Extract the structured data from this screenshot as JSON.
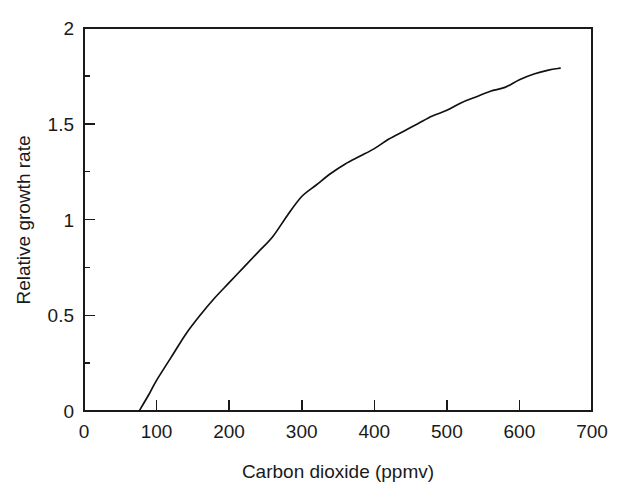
{
  "chart_data": {
    "type": "line",
    "title": "",
    "xlabel": "Carbon dioxide (ppmv)",
    "ylabel": "Relative growth rate",
    "xlim": [
      0,
      700
    ],
    "ylim": [
      0,
      2
    ],
    "grid": false,
    "legend": null,
    "x_ticks": [
      0,
      100,
      200,
      300,
      400,
      500,
      600,
      700
    ],
    "x_tick_labels": [
      "0",
      "100",
      "200",
      "300",
      "400",
      "500",
      "600",
      "700"
    ],
    "y_ticks": [
      0,
      0.5,
      1,
      1.5,
      2
    ],
    "y_tick_labels": [
      "0",
      "0.5",
      "1",
      "1.5",
      "2"
    ],
    "y_minor_ticks": [
      0.25,
      0.75,
      1.25,
      1.75
    ],
    "line_color": "#111111",
    "series": [
      {
        "name": "Relative growth rate",
        "x": [
          76,
          90,
          100,
          120,
          140,
          160,
          180,
          200,
          220,
          240,
          260,
          280,
          300,
          320,
          340,
          360,
          380,
          400,
          420,
          440,
          460,
          480,
          500,
          520,
          540,
          560,
          580,
          600,
          620,
          640,
          656
        ],
        "y": [
          0.0,
          0.09,
          0.16,
          0.28,
          0.4,
          0.5,
          0.59,
          0.67,
          0.75,
          0.83,
          0.91,
          1.02,
          1.12,
          1.18,
          1.24,
          1.29,
          1.33,
          1.37,
          1.42,
          1.46,
          1.5,
          1.54,
          1.57,
          1.61,
          1.64,
          1.67,
          1.69,
          1.73,
          1.76,
          1.78,
          1.79
        ]
      }
    ]
  },
  "axes": {
    "x_title": "Carbon dioxide (ppmv)",
    "y_title": "Relative growth rate"
  },
  "ticks": {
    "x": [
      "0",
      "100",
      "200",
      "300",
      "400",
      "500",
      "600",
      "700"
    ],
    "y": [
      "0",
      "0.5",
      "1",
      "1.5",
      "2"
    ]
  }
}
